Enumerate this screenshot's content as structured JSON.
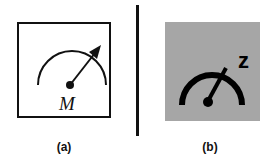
{
  "figure": {
    "panels": [
      {
        "id": "a",
        "caption": "(a)",
        "icon": "meter-gauge-icon",
        "symbol_label": "M",
        "background": "#ffffff",
        "border": "#111111"
      },
      {
        "id": "b",
        "caption": "(b)",
        "icon": "sleep-gauge-icon",
        "symbol_label": "z",
        "background": "#a6a6a6"
      }
    ],
    "divider_color": "#111111"
  }
}
